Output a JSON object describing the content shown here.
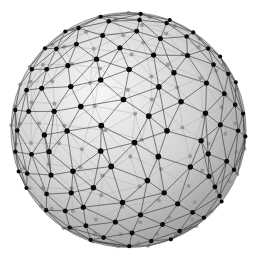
{
  "figure": {
    "vertex_count": 200,
    "neighbors_per_vertex": 6,
    "rotation_deg": {
      "x": 18,
      "y": -25
    },
    "colors": {
      "background": "#ffffff",
      "sphere_light": "#f6f6f6",
      "sphere_mid": "#d2d2d2",
      "sphere_dark": "#9a9a9a",
      "rim": "#7a7a7a",
      "front_edge": "#3a3a3a",
      "back_edge": "#a8a8a8",
      "front_vertex": "#0a0a0a",
      "back_vertex": "#8c8c8c"
    }
  }
}
